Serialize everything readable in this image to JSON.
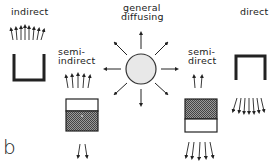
{
  "figure": {
    "panel_label": "b",
    "center": {
      "label_line1": "general",
      "label_line2": "diffusing",
      "shape": "circle",
      "fill": "#e8e8e8"
    },
    "fixtures": [
      {
        "id": "indirect",
        "label": "indirect",
        "light": "up"
      },
      {
        "id": "semi-indirect",
        "label_line1": "semi-",
        "label_line2": "indirect",
        "light": "mostly-up"
      },
      {
        "id": "semi-direct",
        "label_line1": "semi-",
        "label_line2": "direct",
        "light": "mostly-down"
      },
      {
        "id": "direct",
        "label": "direct",
        "light": "down"
      }
    ],
    "colors": {
      "ink": "#222222",
      "hatch": "#555555",
      "circle_fill": "#e8e8e8"
    }
  }
}
